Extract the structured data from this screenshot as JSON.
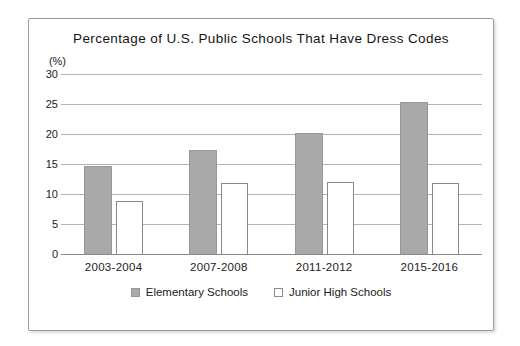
{
  "chart_data": {
    "type": "bar",
    "title": "Percentage of U.S. Public Schools That Have Dress Codes",
    "unit_label": "(%)",
    "categories": [
      "2003-2004",
      "2007-2008",
      "2011-2012",
      "2015-2016"
    ],
    "series": [
      {
        "name": "Elementary Schools",
        "color": "#a9a9a9",
        "border_color": "#979797",
        "values": [
          14.7,
          17.4,
          20.1,
          25.3
        ]
      },
      {
        "name": "Junior High Schools",
        "color": "#ffffff",
        "border_color": "#8a8a8a",
        "values": [
          8.9,
          11.9,
          12.0,
          11.8
        ]
      }
    ],
    "xlabel": "",
    "ylabel": "",
    "ylim": [
      0,
      30
    ],
    "yticks": [
      0,
      5,
      10,
      15,
      20,
      25,
      30
    ],
    "grid": true,
    "legend_position": "bottom"
  },
  "colors": {
    "background": "#ffffff",
    "frame_border": "#9c9c9c",
    "gridline": "#b4b4b4",
    "axis_line": "#8a8a8a",
    "text": "#1a1a1a"
  }
}
